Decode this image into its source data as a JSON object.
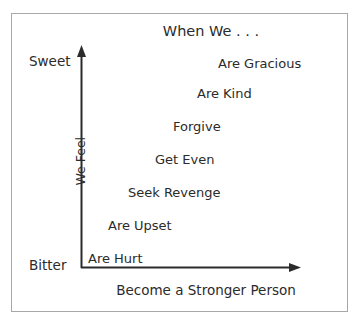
{
  "figure": {
    "title": "When We . . .",
    "y_axis": {
      "label": "We Feel",
      "top_tick_label": "Sweet",
      "bottom_tick_label": "Bitter"
    },
    "x_axis": {
      "label": "Become a Stronger Person"
    }
  },
  "chart_data": {
    "type": "scatter",
    "title": "When We . . .",
    "xlabel": "Become a Stronger Person",
    "ylabel": "We Feel",
    "grid": false,
    "legend": "none",
    "x": [
      1,
      2,
      3,
      4,
      5,
      6,
      7
    ],
    "y": [
      1,
      2,
      3,
      4,
      5,
      6,
      7
    ],
    "point_labels": [
      "Are Hurt",
      "Are Upset",
      "Seek Revenge",
      "Get Even",
      "Forgive",
      "Are Kind",
      "Are Gracious"
    ],
    "xlim": [
      0,
      8
    ],
    "ylim": [
      0,
      8
    ],
    "ytick_labels": [
      "Bitter",
      "Sweet"
    ],
    "ytick_positions": [
      0,
      8
    ],
    "xtick_labels": [],
    "annotation": "Emotional progression ascends from Bitter to Sweet as one becomes a stronger person.",
    "steps": [
      {
        "label": "Are Hurt",
        "left": 88,
        "top": 252
      },
      {
        "label": "Are Upset",
        "left": 108,
        "top": 219
      },
      {
        "label": "Seek Revenge",
        "left": 128,
        "top": 186
      },
      {
        "label": "Get Even",
        "left": 155,
        "top": 153
      },
      {
        "label": "Forgive",
        "left": 173,
        "top": 120
      },
      {
        "label": "Are Kind",
        "left": 197,
        "top": 87
      },
      {
        "label": "Are Gracious",
        "left": 218,
        "top": 57
      }
    ]
  },
  "colors": {
    "axis": "#2b2b2b",
    "frame": "#a8a8a8",
    "text": "#2b2b2b",
    "background": "#ffffff"
  }
}
